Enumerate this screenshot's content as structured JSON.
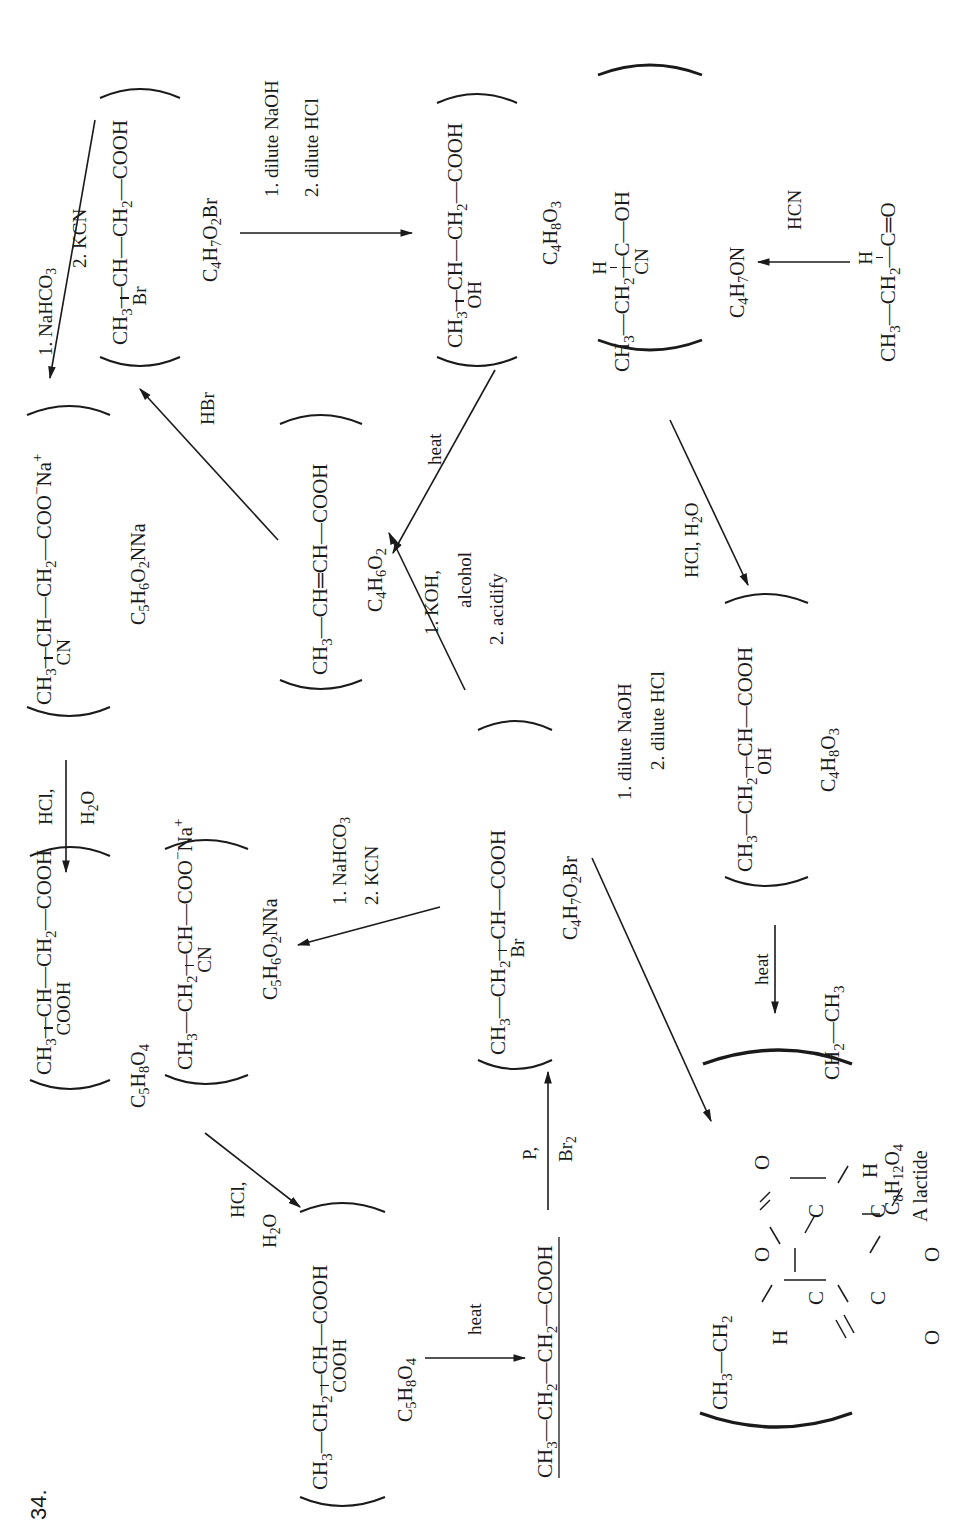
{
  "problem_number": "34.",
  "compounds": {
    "c1": {
      "main": [
        "CH",
        "3",
        "—CH—CH",
        "2",
        "—COOH"
      ],
      "branch": "COOH",
      "mf": "C5H8O4",
      "mf_parts": [
        "C",
        "5",
        "H",
        "8",
        "O",
        "4"
      ]
    },
    "c2": {
      "main": [
        "CH",
        "3",
        "—CH—CH",
        "2",
        "—COO",
        "−",
        "Na",
        "+"
      ],
      "branch": "CN",
      "mf_parts": [
        "C",
        "5",
        "H",
        "6",
        "O",
        "2",
        "NNa"
      ]
    },
    "c3": {
      "main": [
        "CH",
        "3",
        "—CH—CH",
        "2",
        "—COOH"
      ],
      "branch": "Br",
      "mf_parts": [
        "C",
        "4",
        "H",
        "7",
        "O",
        "2",
        "Br"
      ]
    },
    "c4": {
      "main": [
        "CH",
        "3",
        "—CH—CH",
        "2",
        "—COOH"
      ],
      "branch": "OH",
      "mf_parts": [
        "C",
        "4",
        "H",
        "8",
        "O",
        "3"
      ]
    },
    "c5": {
      "main": [
        "CH",
        "3",
        "—CH",
        "2",
        "—C—OH"
      ],
      "top": "H",
      "branch": "CN",
      "mf_parts": [
        "C",
        "4",
        "H",
        "7",
        "ON"
      ]
    },
    "c6": {
      "main": [
        "CH",
        "3",
        "—CH",
        "2",
        "—C═O"
      ],
      "top": "H"
    },
    "c7": {
      "main": [
        "CH",
        "3",
        "—CH═CH—COOH"
      ],
      "mf_parts": [
        "C",
        "4",
        "H",
        "6",
        "O",
        "2"
      ]
    },
    "c8": {
      "main": [
        "CH",
        "3",
        "—CH",
        "2",
        "—CH—COO",
        "−",
        "Na",
        "+"
      ],
      "branch": "CN",
      "mf_parts": [
        "C",
        "5",
        "H",
        "6",
        "O",
        "2",
        "NNa"
      ]
    },
    "c9": {
      "main": [
        "CH",
        "3",
        "—CH",
        "2",
        "—CH—COOH"
      ],
      "branch": "Br",
      "mf_parts": [
        "C",
        "4",
        "H",
        "7",
        "O",
        "2",
        "Br"
      ]
    },
    "c10": {
      "main": [
        "CH",
        "3",
        "—CH",
        "2",
        "—CH—COOH"
      ],
      "branch": "OH",
      "mf_parts": [
        "C",
        "4",
        "H",
        "8",
        "O",
        "3"
      ]
    },
    "c11": {
      "main": [
        "CH",
        "3",
        "—CH",
        "2",
        "—CH—COOH"
      ],
      "branch": "COOH",
      "mf_parts": [
        "C",
        "5",
        "H",
        "8",
        "O",
        "4"
      ]
    },
    "c12": {
      "main": [
        "CH",
        "3",
        "—CH",
        "2",
        "—CH",
        "2",
        "—COOH"
      ]
    },
    "lactide": {
      "atoms": {
        "o_top_left": "O",
        "o_top_right": "O",
        "o_ring_top": "O",
        "o_ring_bottom": "O",
        "c1": "C",
        "c2": "C",
        "c3": "C",
        "c4": "C",
        "h_top": "H",
        "h_bottom": "H"
      },
      "left_group": [
        "CH",
        "3",
        "—CH",
        "2"
      ],
      "right_group": [
        "CH",
        "2",
        "—CH",
        "3"
      ],
      "mf_parts": [
        "C",
        "8",
        "H",
        "12",
        "O",
        "4"
      ],
      "caption": "A lactide"
    }
  },
  "reagents": {
    "r_nahco3_kcn_top": [
      "1.  NaHCO",
      "3",
      "2.  KCN"
    ],
    "r_dilute_top": [
      "1.  dilute NaOH",
      "2.  dilute HCl"
    ],
    "r_hcn": "HCN",
    "r_hbr": "HBr",
    "r_heat_top": "heat",
    "r_hcl_h2o_right": [
      "HCl, H",
      "2",
      "O"
    ],
    "r_koh": [
      "1.  KOH,",
      "alcohol",
      "2.  acidify"
    ],
    "r_hcl_h2o_left": [
      "HCl,",
      "H",
      "2",
      "O"
    ],
    "r_nahco3_kcn_mid": [
      "1.  NaHCO",
      "3",
      "2.  KCN"
    ],
    "r_dilute_mid": [
      "1.  dilute NaOH",
      "2.  dilute HCl"
    ],
    "r_heat_mid": "heat",
    "r_hcl_h2o_bottom": [
      "HCl,",
      "H",
      "2",
      "O"
    ],
    "r_heat_bottom": "heat",
    "r_p_br2": [
      "P,",
      "Br",
      "2"
    ]
  }
}
